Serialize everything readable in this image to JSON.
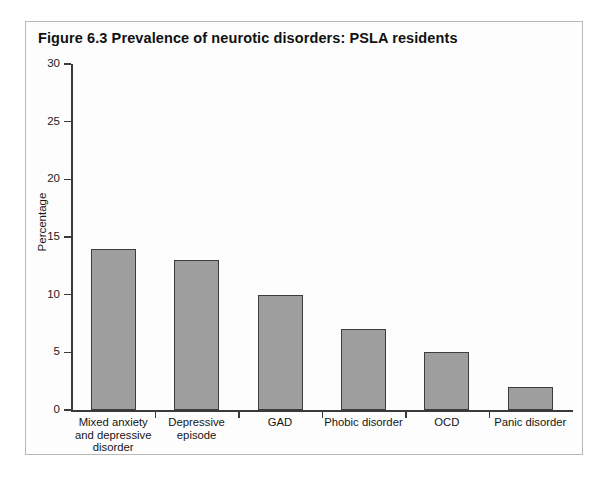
{
  "figure": {
    "title": "Figure 6.3  Prevalence of neurotic disorders: PSLA residents"
  },
  "colors": {
    "bar_fill": "#9e9e9e",
    "bar_stroke": "#3d3d3d",
    "axis": "#3a3a3a",
    "frame": "#b9b9b9",
    "background": "#ffffff",
    "text": "#151515"
  },
  "chart_data": {
    "type": "bar",
    "title": "Figure 6.3  Prevalence of neurotic disorders: PSLA residents",
    "xlabel": "",
    "ylabel": "Percentage",
    "categories": [
      "Mixed anxiety\nand depressive\ndisorder",
      "Depressive\nepisode",
      "GAD",
      "Phobic disorder",
      "OCD",
      "Panic disorder"
    ],
    "values": [
      14,
      13,
      10,
      7,
      5,
      2
    ],
    "ylim": [
      0,
      30
    ],
    "yticks": [
      0,
      5,
      10,
      15,
      20,
      25,
      30
    ],
    "ytick_labels": [
      "0",
      "5",
      "10",
      "15",
      "20",
      "25",
      "30"
    ],
    "grid": false,
    "legend": null
  }
}
